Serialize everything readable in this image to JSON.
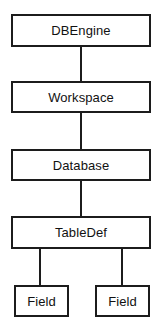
{
  "diagram": {
    "type": "hierarchy-tree",
    "orientation": "vertical-top-down",
    "background_color": "#ffffff",
    "line_color": "#1c1c1c",
    "box_fill_color": "#ffffff",
    "nodes": [
      {
        "id": "dbengine",
        "label": "DBEngine",
        "level": 0,
        "x": 11,
        "y": 14,
        "width": 140,
        "height": 33
      },
      {
        "id": "workspace",
        "label": "Workspace",
        "level": 1,
        "x": 11,
        "y": 81,
        "width": 140,
        "height": 32
      },
      {
        "id": "database",
        "label": "Database",
        "level": 2,
        "x": 11,
        "y": 149,
        "width": 140,
        "height": 32
      },
      {
        "id": "tabledef",
        "label": "TableDef",
        "level": 3,
        "x": 11,
        "y": 216,
        "width": 140,
        "height": 33
      },
      {
        "id": "field-left",
        "label": "Field",
        "level": 4,
        "x": 14,
        "y": 285,
        "width": 55,
        "height": 32
      },
      {
        "id": "field-right",
        "label": "Field",
        "level": 4,
        "x": 95,
        "y": 285,
        "width": 55,
        "height": 32
      }
    ],
    "edges": [
      {
        "id": "edge-dbengine-workspace",
        "from": "dbengine",
        "to": "workspace",
        "x": 80,
        "y": 47,
        "length": 34
      },
      {
        "id": "edge-workspace-database",
        "from": "workspace",
        "to": "database",
        "x": 80,
        "y": 113,
        "length": 36
      },
      {
        "id": "edge-database-tabledef",
        "from": "database",
        "to": "tabledef",
        "x": 80,
        "y": 181,
        "length": 35
      },
      {
        "id": "edge-tabledef-field-left",
        "from": "tabledef",
        "to": "field-left",
        "x": 39,
        "y": 249,
        "length": 36
      },
      {
        "id": "edge-tabledef-field-right",
        "from": "tabledef",
        "to": "field-right",
        "x": 121,
        "y": 249,
        "length": 36
      }
    ]
  }
}
